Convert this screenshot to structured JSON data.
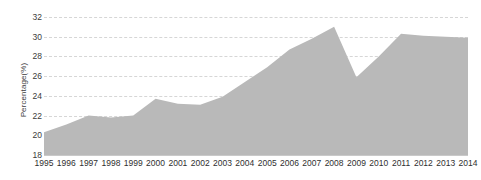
{
  "chart_data": {
    "type": "area",
    "title": "",
    "subtitle": "",
    "xlabel": "",
    "ylabel": "Percentage(%)",
    "categories": [
      "1995",
      "1996",
      "1997",
      "1998",
      "1999",
      "2000",
      "2001",
      "2002",
      "2003",
      "2004",
      "2005",
      "2006",
      "2007",
      "2008",
      "2009",
      "2010",
      "2011",
      "2012",
      "2013",
      "2014"
    ],
    "values": [
      20.3,
      21.1,
      22.0,
      21.8,
      22.0,
      23.7,
      23.2,
      23.1,
      23.9,
      25.4,
      26.9,
      28.7,
      29.8,
      31.0,
      25.9,
      28.0,
      30.3,
      30.1,
      30.0,
      29.9
    ],
    "series": [
      {
        "name": "Percentage",
        "values": [
          20.3,
          21.1,
          22.0,
          21.8,
          22.0,
          23.7,
          23.2,
          23.1,
          23.9,
          25.4,
          26.9,
          28.7,
          29.8,
          31.0,
          25.9,
          28.0,
          30.3,
          30.1,
          30.0,
          29.9
        ]
      }
    ],
    "ylim": [
      18,
      32
    ],
    "ytick_step": 2,
    "yticks": [
      18,
      20,
      22,
      24,
      26,
      28,
      30,
      32
    ],
    "ytick_labels": [
      "18",
      "20",
      "22",
      "24",
      "26",
      "28",
      "30",
      "32"
    ],
    "xticks": [
      "1995",
      "1996",
      "1997",
      "1998",
      "1999",
      "2000",
      "2001",
      "2002",
      "2003",
      "2004",
      "2005",
      "2006",
      "2007",
      "2008",
      "2009",
      "2010",
      "2011",
      "2012",
      "2013",
      "2014"
    ],
    "grid": true,
    "grid_axis": "y",
    "grid_style": "dashed",
    "legend": false,
    "legend_position": "none",
    "annotations": [],
    "colors": {
      "area_fill": "#b9b9b9",
      "gridline": "#d6d6d6",
      "baseline": "#c9c9c9",
      "tick_text": "#2f2f2f",
      "axis_title_text": "#3b3b3b",
      "background": "#ffffff"
    }
  }
}
